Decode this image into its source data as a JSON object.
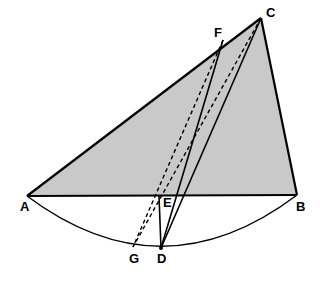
{
  "figure": {
    "type": "geometry-diagram",
    "title": "",
    "background_color": "#ffffff",
    "stroke_color": "#000000",
    "fill_color": "#c9c9c9",
    "labels": [
      {
        "id": "A",
        "text": "A",
        "x": 20,
        "y": 200
      },
      {
        "id": "B",
        "text": "B",
        "x": 296,
        "y": 200
      },
      {
        "id": "C",
        "text": "C",
        "x": 266,
        "y": 6
      },
      {
        "id": "D",
        "text": "D",
        "x": 157,
        "y": 252
      },
      {
        "id": "E",
        "text": "E",
        "x": 163,
        "y": 196
      },
      {
        "id": "F",
        "text": "F",
        "x": 214,
        "y": 26
      },
      {
        "id": "G",
        "text": "G",
        "x": 129,
        "y": 252
      }
    ],
    "points": {
      "A": {
        "x": 27,
        "y": 196
      },
      "B": {
        "x": 297,
        "y": 195
      },
      "C": {
        "x": 261,
        "y": 18
      },
      "D": {
        "x": 161,
        "y": 248
      },
      "E": {
        "x": 159,
        "y": 196
      },
      "F": {
        "x": 223,
        "y": 40
      },
      "G": {
        "x": 133,
        "y": 247
      }
    },
    "shapes": {
      "shaded_triangle": "A-B-C",
      "arc": "A to B through G and D (bulging downward)",
      "solid_segments": [
        "A-B",
        "B-C",
        "C-A",
        "E-D",
        "F-D",
        "C-D"
      ],
      "dashed_segments": [
        "E-G",
        "F-G",
        "C-G"
      ]
    }
  }
}
